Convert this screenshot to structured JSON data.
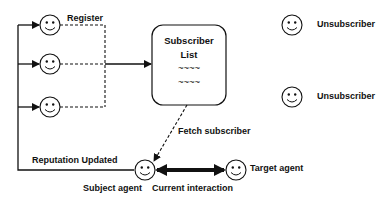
{
  "diagram": {
    "title": "",
    "labels": {
      "register": "Register",
      "subscriber_list_line1": "Subscriber",
      "subscriber_list_line2": "List",
      "list_placeholder_1": "~~~~",
      "list_placeholder_2": "~~~~",
      "unsubscriber_1": "Unsubscriber",
      "unsubscriber_2": "Unsubscriber",
      "fetch_subscriber": "Fetch subscriber",
      "reputation_updated": "Reputation Updated",
      "subject_agent": "Subject agent",
      "current_interaction": "Current interaction",
      "target_agent": "Target agent"
    },
    "nodes": [
      {
        "id": "subscriber-1",
        "type": "smiley-agent",
        "role": "subscriber"
      },
      {
        "id": "subscriber-2",
        "type": "smiley-agent",
        "role": "subscriber"
      },
      {
        "id": "subscriber-3",
        "type": "smiley-agent",
        "role": "subscriber"
      },
      {
        "id": "subscriber-list",
        "type": "rounded-box"
      },
      {
        "id": "unsubscriber-1",
        "type": "smiley-agent",
        "role": "unsubscriber"
      },
      {
        "id": "unsubscriber-2",
        "type": "smiley-agent",
        "role": "unsubscriber"
      },
      {
        "id": "subject-agent",
        "type": "smiley-agent",
        "role": "subject"
      },
      {
        "id": "target-agent",
        "type": "smiley-agent",
        "role": "target"
      }
    ],
    "edges": [
      {
        "from": "subscriber-1",
        "to": "subscriber-list",
        "style": "dashed",
        "label": "Register"
      },
      {
        "from": "subscriber-2",
        "to": "subscriber-list",
        "style": "dashed"
      },
      {
        "from": "subscriber-3",
        "to": "subscriber-list",
        "style": "dashed"
      },
      {
        "from": "subscriber-list",
        "to": "subject-agent",
        "style": "dashed",
        "label": "Fetch subscriber"
      },
      {
        "from": "subject-agent",
        "to": "target-agent",
        "style": "thick-bidirectional",
        "label": "Current interaction"
      },
      {
        "from": "subject-agent",
        "to": "subscriber-1",
        "style": "solid",
        "label": "Reputation Updated"
      },
      {
        "from": "subject-agent",
        "to": "subscriber-2",
        "style": "solid"
      },
      {
        "from": "subject-agent",
        "to": "subscriber-3",
        "style": "solid"
      }
    ],
    "colors": {
      "stroke": "#111111",
      "background": "#ffffff"
    }
  }
}
